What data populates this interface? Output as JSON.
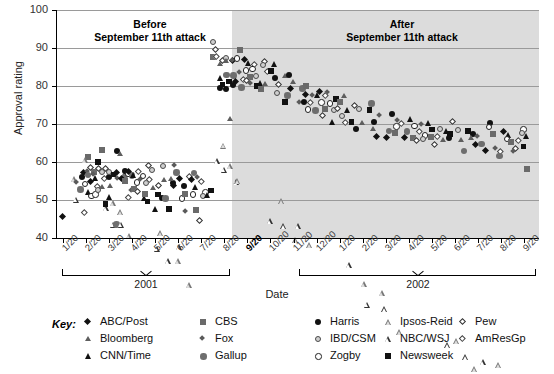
{
  "chart_data": {
    "type": "scatter",
    "title": "",
    "xlabel": "Date",
    "ylabel": "Approval rating",
    "ylim": [
      40,
      100
    ],
    "yticks": [
      40,
      50,
      60,
      70,
      80,
      90,
      100
    ],
    "grid": true,
    "legend_position": "bottom",
    "annotations": [
      {
        "id": "before",
        "line1": "Before",
        "line2": "September 11th attack"
      },
      {
        "id": "after",
        "line1": "After",
        "line2": "September 11th attack"
      }
    ],
    "shaded_region": {
      "label": "After September 11th attack",
      "start": "9/20/2001",
      "end": "9/20/2002",
      "color": "#dcdcdc"
    },
    "x_axis": {
      "groups": [
        {
          "year": "2001",
          "ticks": [
            "1/20",
            "2/20",
            "3/20",
            "4/20",
            "5/20",
            "6/20",
            "7/20",
            "8/20",
            "9/20",
            "10/20",
            "11/20",
            "12/20"
          ],
          "highlight": "9/20"
        },
        {
          "year": "2002",
          "ticks": [
            "1/20",
            "2/20",
            "3/20",
            "4/20",
            "5/20",
            "6/20",
            "7/20",
            "8/20",
            "9/20"
          ],
          "highlight": ""
        }
      ]
    },
    "series": [
      {
        "name": "ABC/Post",
        "marker": "m-dia-f",
        "color": "#111111"
      },
      {
        "name": "Bloomberg",
        "marker": "m-tri-g",
        "color": "#5e5e5e"
      },
      {
        "name": "CNN/Time",
        "marker": "m-tri-f",
        "color": "#111111"
      },
      {
        "name": "CBS",
        "marker": "m-square-g",
        "color": "#6a6a6a"
      },
      {
        "name": "Fox",
        "marker": "m-dia-g",
        "color": "#5a5a5a"
      },
      {
        "name": "Gallup",
        "marker": "m-circle-g",
        "color": "#6e6e6e"
      },
      {
        "name": "Harris",
        "marker": "m-circle-f",
        "color": "#111111"
      },
      {
        "name": "IBD/CSM",
        "marker": "m-circle-ibd",
        "color": "#cfcfcf"
      },
      {
        "name": "Zogby",
        "marker": "m-circle-o",
        "color": "#ffffff"
      },
      {
        "name": "Ipsos-Reid",
        "marker": "m-tri-ip",
        "color": "#777777"
      },
      {
        "name": "NBC/WSJ",
        "marker": "m-tri-o",
        "color": "#333333"
      },
      {
        "name": "Newsweek",
        "marker": "m-square-f",
        "color": "#111111"
      },
      {
        "name": "Pew",
        "marker": "m-dia-o",
        "color": "#333333"
      },
      {
        "name": "AmResGp",
        "marker": "m-dia-a",
        "color": "#444444"
      }
    ],
    "points": [
      [
        0.1,
        45
      ],
      [
        0.45,
        56
      ],
      [
        0.5,
        55
      ],
      [
        0.62,
        52
      ],
      [
        0.7,
        53
      ],
      [
        0.78,
        57
      ],
      [
        0.84,
        56
      ],
      [
        0.88,
        54
      ],
      [
        0.92,
        61
      ],
      [
        0.95,
        63
      ],
      [
        0.98,
        58
      ],
      [
        1.02,
        47
      ],
      [
        1.05,
        57
      ],
      [
        1.1,
        55
      ],
      [
        1.14,
        52
      ],
      [
        1.18,
        51
      ],
      [
        1.22,
        57
      ],
      [
        1.26,
        58
      ],
      [
        1.3,
        56
      ],
      [
        1.34,
        54
      ],
      [
        1.4,
        52
      ],
      [
        1.44,
        53
      ],
      [
        1.48,
        56
      ],
      [
        1.52,
        60
      ],
      [
        1.56,
        63
      ],
      [
        1.6,
        58
      ],
      [
        1.66,
        57
      ],
      [
        1.7,
        55
      ],
      [
        1.74,
        54
      ],
      [
        1.78,
        53
      ],
      [
        1.82,
        51
      ],
      [
        1.86,
        49
      ],
      [
        1.9,
        56
      ],
      [
        1.94,
        58
      ],
      [
        1.98,
        57
      ],
      [
        2.04,
        55
      ],
      [
        2.08,
        53
      ],
      [
        2.12,
        52
      ],
      [
        2.18,
        44
      ],
      [
        2.24,
        57
      ],
      [
        2.28,
        63
      ],
      [
        2.32,
        62
      ],
      [
        2.36,
        57
      ],
      [
        2.4,
        56
      ],
      [
        2.46,
        55
      ],
      [
        2.5,
        54
      ],
      [
        2.56,
        57
      ],
      [
        2.62,
        56
      ],
      [
        2.66,
        58
      ],
      [
        2.7,
        57
      ],
      [
        2.74,
        55
      ],
      [
        2.78,
        53
      ],
      [
        2.82,
        52
      ],
      [
        2.86,
        50
      ],
      [
        2.9,
        56
      ],
      [
        2.96,
        58
      ],
      [
        3.02,
        57
      ],
      [
        3.08,
        55
      ],
      [
        3.14,
        53
      ],
      [
        3.2,
        52
      ],
      [
        3.26,
        55
      ],
      [
        3.32,
        57
      ],
      [
        3.4,
        56
      ],
      [
        3.46,
        54
      ],
      [
        3.52,
        51
      ],
      [
        3.58,
        50
      ],
      [
        3.64,
        52
      ],
      [
        3.7,
        59
      ],
      [
        3.76,
        58
      ],
      [
        3.82,
        55
      ],
      [
        3.88,
        53
      ],
      [
        3.94,
        51
      ],
      [
        4.0,
        47
      ],
      [
        4.06,
        52
      ],
      [
        4.12,
        51
      ],
      [
        4.18,
        54
      ],
      [
        4.24,
        59
      ],
      [
        4.3,
        57
      ],
      [
        4.36,
        55
      ],
      [
        4.44,
        51
      ],
      [
        4.5,
        50
      ],
      [
        4.56,
        47
      ],
      [
        4.64,
        55
      ],
      [
        4.7,
        56
      ],
      [
        4.76,
        54
      ],
      [
        4.82,
        53
      ],
      [
        4.88,
        59
      ],
      [
        4.94,
        58
      ],
      [
        5.0,
        57
      ],
      [
        5.06,
        55
      ],
      [
        5.12,
        53
      ],
      [
        5.2,
        51
      ],
      [
        5.26,
        52
      ],
      [
        5.32,
        50
      ],
      [
        5.38,
        47
      ],
      [
        5.44,
        56
      ],
      [
        5.52,
        57
      ],
      [
        5.58,
        55
      ],
      [
        5.64,
        53
      ],
      [
        5.7,
        51
      ],
      [
        5.76,
        48
      ],
      [
        5.84,
        45
      ],
      [
        5.92,
        56
      ],
      [
        5.98,
        55
      ],
      [
        6.04,
        52
      ],
      [
        6.12,
        51
      ],
      [
        6.2,
        51
      ],
      [
        6.28,
        52
      ],
      [
        6.5,
        87
      ],
      [
        6.56,
        90
      ],
      [
        6.6,
        92
      ],
      [
        6.64,
        88
      ],
      [
        6.68,
        86
      ],
      [
        6.72,
        84
      ],
      [
        6.76,
        82
      ],
      [
        6.8,
        80
      ],
      [
        6.84,
        79
      ],
      [
        6.88,
        86
      ],
      [
        6.92,
        88
      ],
      [
        6.96,
        90
      ],
      [
        7.0,
        87
      ],
      [
        7.04,
        85
      ],
      [
        7.06,
        83
      ],
      [
        7.1,
        81
      ],
      [
        7.14,
        79
      ],
      [
        7.18,
        71
      ],
      [
        7.22,
        86
      ],
      [
        7.26,
        88
      ],
      [
        7.3,
        87
      ],
      [
        7.34,
        85
      ],
      [
        7.38,
        83
      ],
      [
        7.42,
        81
      ],
      [
        7.46,
        80
      ],
      [
        7.52,
        87
      ],
      [
        7.56,
        89
      ],
      [
        7.6,
        86
      ],
      [
        7.64,
        84
      ],
      [
        7.7,
        82
      ],
      [
        7.76,
        80
      ],
      [
        7.82,
        87
      ],
      [
        7.88,
        86
      ],
      [
        7.94,
        84
      ],
      [
        8.0,
        82
      ],
      [
        8.06,
        81
      ],
      [
        8.12,
        80
      ],
      [
        8.2,
        86
      ],
      [
        8.26,
        85
      ],
      [
        8.32,
        83
      ],
      [
        8.4,
        81
      ],
      [
        8.46,
        80
      ],
      [
        8.54,
        79
      ],
      [
        8.62,
        86
      ],
      [
        8.7,
        85
      ],
      [
        8.78,
        83
      ],
      [
        8.86,
        81
      ],
      [
        8.94,
        78
      ],
      [
        9.02,
        86
      ],
      [
        9.08,
        84
      ],
      [
        9.16,
        82
      ],
      [
        9.24,
        80
      ],
      [
        9.3,
        78
      ],
      [
        9.4,
        84
      ],
      [
        9.48,
        82
      ],
      [
        9.56,
        80
      ],
      [
        9.64,
        78
      ],
      [
        9.72,
        76
      ],
      [
        9.8,
        83
      ],
      [
        9.88,
        81
      ],
      [
        9.96,
        79
      ],
      [
        10.04,
        77
      ],
      [
        10.12,
        75
      ],
      [
        10.22,
        82
      ],
      [
        10.3,
        80
      ],
      [
        10.36,
        78
      ],
      [
        10.44,
        76
      ],
      [
        10.52,
        74
      ],
      [
        10.6,
        80
      ],
      [
        10.66,
        79
      ],
      [
        10.74,
        77
      ],
      [
        10.82,
        75
      ],
      [
        10.9,
        73
      ],
      [
        11.0,
        79
      ],
      [
        11.06,
        78
      ],
      [
        11.14,
        76
      ],
      [
        11.22,
        74
      ],
      [
        11.3,
        72
      ],
      [
        11.4,
        78
      ],
      [
        11.48,
        77
      ],
      [
        11.56,
        75
      ],
      [
        11.62,
        73
      ],
      [
        11.7,
        71
      ],
      [
        11.8,
        77
      ],
      [
        11.88,
        76
      ],
      [
        11.96,
        74
      ],
      [
        12.04,
        72
      ],
      [
        12.12,
        70
      ],
      [
        12.2,
        77
      ],
      [
        12.3,
        75
      ],
      [
        12.4,
        73
      ],
      [
        12.5,
        71
      ],
      [
        12.6,
        69
      ],
      [
        12.7,
        75
      ],
      [
        12.8,
        74
      ],
      [
        12.9,
        72
      ],
      [
        13.0,
        70
      ],
      [
        13.1,
        68
      ],
      [
        13.2,
        75
      ],
      [
        13.3,
        73
      ],
      [
        13.4,
        71
      ],
      [
        13.5,
        69
      ],
      [
        13.6,
        67
      ],
      [
        13.7,
        73
      ],
      [
        13.8,
        72
      ],
      [
        13.9,
        70
      ],
      [
        14.0,
        68
      ],
      [
        14.1,
        66
      ],
      [
        14.2,
        72
      ],
      [
        14.3,
        70
      ],
      [
        14.4,
        68
      ],
      [
        14.5,
        66
      ],
      [
        14.6,
        71
      ],
      [
        14.7,
        70
      ],
      [
        14.8,
        68
      ],
      [
        14.9,
        66
      ],
      [
        15.0,
        71
      ],
      [
        15.1,
        69
      ],
      [
        15.2,
        67
      ],
      [
        15.3,
        66
      ],
      [
        15.4,
        70
      ],
      [
        15.5,
        68
      ],
      [
        15.6,
        67
      ],
      [
        15.7,
        66
      ],
      [
        15.8,
        70
      ],
      [
        15.9,
        68
      ],
      [
        16.0,
        66
      ],
      [
        16.1,
        65
      ],
      [
        16.2,
        69
      ],
      [
        16.3,
        67
      ],
      [
        16.4,
        66
      ],
      [
        16.5,
        64
      ],
      [
        16.6,
        68
      ],
      [
        16.7,
        67
      ],
      [
        16.8,
        66
      ],
      [
        16.9,
        70
      ],
      [
        17.0,
        69
      ],
      [
        17.1,
        67
      ],
      [
        17.2,
        66
      ],
      [
        17.3,
        64
      ],
      [
        17.4,
        63
      ],
      [
        17.5,
        68
      ],
      [
        17.6,
        67
      ],
      [
        17.7,
        66
      ],
      [
        17.8,
        64
      ],
      [
        17.9,
        63
      ],
      [
        18.0,
        67
      ],
      [
        18.1,
        66
      ],
      [
        18.2,
        65
      ],
      [
        18.3,
        63
      ],
      [
        18.4,
        70
      ],
      [
        18.5,
        69
      ],
      [
        18.6,
        67
      ],
      [
        18.7,
        66
      ],
      [
        18.8,
        64
      ],
      [
        18.9,
        63
      ],
      [
        19.0,
        62
      ],
      [
        19.1,
        68
      ],
      [
        19.2,
        67
      ],
      [
        19.3,
        66
      ],
      [
        19.4,
        65
      ],
      [
        19.5,
        63
      ],
      [
        19.6,
        62
      ],
      [
        19.7,
        66
      ],
      [
        19.8,
        69
      ],
      [
        19.9,
        68
      ],
      [
        20.0,
        67
      ],
      [
        20.05,
        64
      ],
      [
        20.1,
        58
      ]
    ]
  },
  "legend": {
    "key_label": "Key:",
    "columns": [
      [
        {
          "name": "ABC/Post"
        },
        {
          "name": "Bloomberg"
        },
        {
          "name": "CNN/Time"
        }
      ],
      [
        {
          "name": "CBS"
        },
        {
          "name": "Fox"
        },
        {
          "name": "Gallup"
        }
      ],
      [
        {
          "name": "Harris"
        },
        {
          "name": "IBD/CSM"
        },
        {
          "name": "Zogby"
        }
      ],
      [
        {
          "name": "Ipsos-Reid"
        },
        {
          "name": "NBC/WSJ"
        },
        {
          "name": "Newsweek"
        }
      ],
      [
        {
          "name": "Pew"
        },
        {
          "name": "AmResGp"
        }
      ]
    ]
  }
}
